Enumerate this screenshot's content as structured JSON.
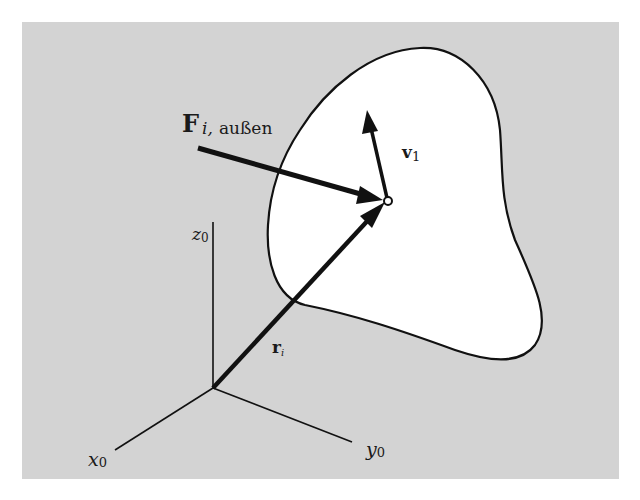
{
  "figure": {
    "background_color": "#ffffff",
    "panel_color": "#d3d3d3",
    "body_fill": "#ffffff",
    "stroke_color": "#111111"
  },
  "labels": {
    "force_main": "F",
    "force_sub_i": "i,",
    "force_sub_text": "außen",
    "velocity_main": "v",
    "velocity_sub": "1",
    "position_main": "r",
    "position_sub": "i",
    "z_axis_main": "z",
    "z_axis_sub": "0",
    "x_axis_main": "x",
    "x_axis_sub": "0",
    "y_axis_main": "y",
    "y_axis_sub": "0"
  }
}
